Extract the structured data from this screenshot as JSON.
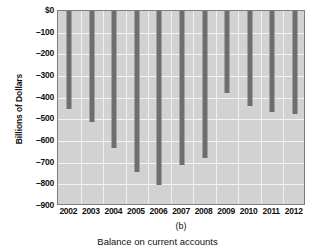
{
  "chart_data": {
    "type": "bar",
    "title": "",
    "panel_label": "(b)",
    "caption": "Balance on current accounts",
    "xlabel": "",
    "ylabel": "Billions of Dollars",
    "categories": [
      "2002",
      "2003",
      "2004",
      "2005",
      "2006",
      "2007",
      "2008",
      "2009",
      "2010",
      "2011",
      "2012"
    ],
    "values": [
      -450,
      -510,
      -630,
      -745,
      -805,
      -710,
      -680,
      -380,
      -440,
      -465,
      -475
    ],
    "ylim": [
      -900,
      0
    ],
    "ytick_values": [
      0,
      -100,
      -200,
      -300,
      -400,
      -500,
      -600,
      -700,
      -800,
      -900
    ],
    "ytick_labels": [
      "$0",
      "–100",
      "–200",
      "–300",
      "–400",
      "–500",
      "–600",
      "–700",
      "–800",
      "–900"
    ],
    "grid": true,
    "legend": "none",
    "bar_color": "#6e6e6e",
    "plot_background": "#d2d2d2",
    "gridline_color": "#f3f3f3",
    "axis_color": "#7d7d7d"
  }
}
